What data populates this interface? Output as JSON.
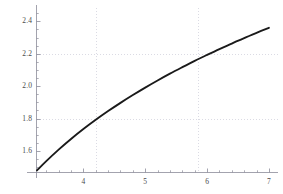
{
  "chart_data": {
    "type": "line",
    "title": "",
    "subtitle": "",
    "xlabel": "",
    "ylabel": "",
    "xlim": [
      3.25,
      7.05
    ],
    "ylim": [
      1.47,
      2.47
    ],
    "x_ticks": [
      4,
      5,
      6,
      7
    ],
    "x_tick_labels": [
      "4",
      "5",
      "6",
      "7"
    ],
    "y_ticks": [
      1.6,
      1.8,
      2.0,
      2.2,
      2.4
    ],
    "y_tick_labels": [
      "1.6",
      "1.8",
      "2.0",
      "2.2",
      "2.4"
    ],
    "x_minor_ticks": [
      3.4,
      3.6,
      3.8,
      4.2,
      4.4,
      4.6,
      4.8,
      5.2,
      5.4,
      5.6,
      5.8,
      6.2,
      6.4,
      6.6,
      6.8
    ],
    "y_minor_ticks": [
      1.5,
      1.55,
      1.65,
      1.7,
      1.75,
      1.85,
      1.9,
      1.95,
      2.05,
      2.1,
      2.15,
      2.25,
      2.3,
      2.35,
      2.45
    ],
    "grid": true,
    "grid_style": "dotted",
    "grid_x_lines": [
      4.2,
      5.85
    ],
    "grid_y_lines": [
      1.8,
      2.2
    ],
    "legend": null,
    "legend_position": "none",
    "line_color": "#1a1a1a",
    "line_width": 1.9,
    "axis_color": "#8c8c99",
    "grid_color": "#ccccd8",
    "tick_label_color": "#4a4a4a",
    "background_color": "#ffffff",
    "series": [
      {
        "name": "curve",
        "x": [
          3.25,
          3.4,
          3.6,
          3.8,
          4.0,
          4.2,
          4.4,
          4.6,
          4.8,
          5.0,
          5.2,
          5.4,
          5.6,
          5.8,
          6.0,
          6.2,
          6.4,
          6.6,
          6.8,
          7.0
        ],
        "y": [
          1.48,
          1.537,
          1.608,
          1.674,
          1.735,
          1.792,
          1.846,
          1.897,
          1.945,
          1.991,
          2.035,
          2.077,
          2.117,
          2.156,
          2.193,
          2.229,
          2.263,
          2.297,
          2.329,
          2.36
        ]
      }
    ],
    "geometry": {
      "plot_left_px": 37,
      "plot_right_px": 272,
      "plot_top_px": 10,
      "plot_bottom_px": 172,
      "x_axis_y_px": 172,
      "y_axis_x_px": 37
    }
  }
}
